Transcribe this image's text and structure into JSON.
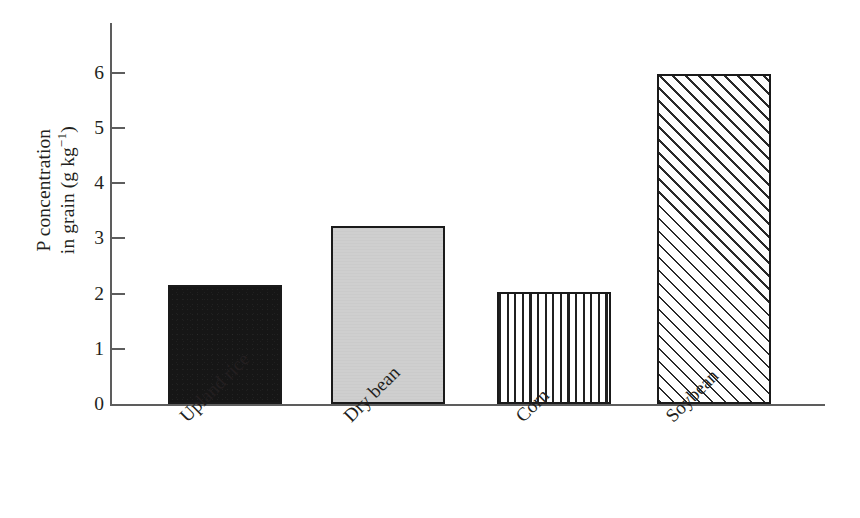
{
  "chart_data": {
    "type": "bar",
    "title": "",
    "xlabel": "",
    "ylabel": "P concentration\nin grain (g kg⁻¹)",
    "ylabel_main": "P concentration",
    "ylabel_units_prefix": "in grain (g kg",
    "ylabel_units_sup": "−1",
    "ylabel_units_suffix": ")",
    "categories": [
      "Upland rice",
      "Dry bean",
      "Corn",
      "Soybean"
    ],
    "values": [
      2.15,
      3.22,
      2.02,
      5.98
    ],
    "ylim": [
      0,
      6.9
    ],
    "yticks": [
      0,
      1,
      2,
      3,
      4,
      5,
      6
    ],
    "ytick_labels": [
      "0",
      "1",
      "2",
      "3",
      "4",
      "5",
      "6"
    ],
    "grid": false,
    "legend": false,
    "bar_fills": [
      "solid-black",
      "light-gray",
      "vertical-stripes",
      "diagonal-hatch"
    ],
    "colors": {
      "axis": "#5d5d5d",
      "bar_outline": "#1a1a1a",
      "solid_black_fill": "#161616",
      "light_gray_fill": "#cfcfcf",
      "hatch_line": "#2a2a2a",
      "background": "#ffffff",
      "text": "#231f20"
    }
  }
}
